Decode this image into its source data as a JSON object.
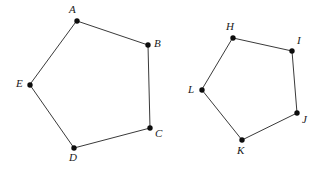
{
  "figure": {
    "background_color": "#ffffff",
    "edge_color": "#3a3a3a",
    "vertex_color": "#0d0d0d",
    "label_color": "#1a1a1a",
    "polygons": [
      {
        "name": "pentagon-abcde",
        "vertices": [
          {
            "label": "A",
            "x": 77,
            "y": 21,
            "label_x": 69,
            "label_y": 4,
            "label_anchor": "above-left"
          },
          {
            "label": "B",
            "x": 148,
            "y": 45,
            "label_x": 154,
            "label_y": 38,
            "label_anchor": "right"
          },
          {
            "label": "C",
            "x": 150,
            "y": 128,
            "label_x": 155,
            "label_y": 128,
            "label_anchor": "lower-right"
          },
          {
            "label": "D",
            "x": 74,
            "y": 148,
            "label_x": 69,
            "label_y": 152,
            "label_anchor": "below"
          },
          {
            "label": "E",
            "x": 30,
            "y": 85,
            "label_x": 16,
            "label_y": 78,
            "label_anchor": "left"
          }
        ]
      },
      {
        "name": "pentagon-hijkl",
        "vertices": [
          {
            "label": "H",
            "x": 233,
            "y": 38,
            "label_x": 226,
            "label_y": 21,
            "label_anchor": "above-left"
          },
          {
            "label": "I",
            "x": 292,
            "y": 51,
            "label_x": 297,
            "label_y": 35,
            "label_anchor": "above-right"
          },
          {
            "label": "J",
            "x": 297,
            "y": 113,
            "label_x": 302,
            "label_y": 114,
            "label_anchor": "lower-right"
          },
          {
            "label": "K",
            "x": 242,
            "y": 140,
            "label_x": 237,
            "label_y": 145,
            "label_anchor": "below"
          },
          {
            "label": "L",
            "x": 202,
            "y": 90,
            "label_x": 188,
            "label_y": 84,
            "label_anchor": "left"
          }
        ]
      }
    ]
  }
}
